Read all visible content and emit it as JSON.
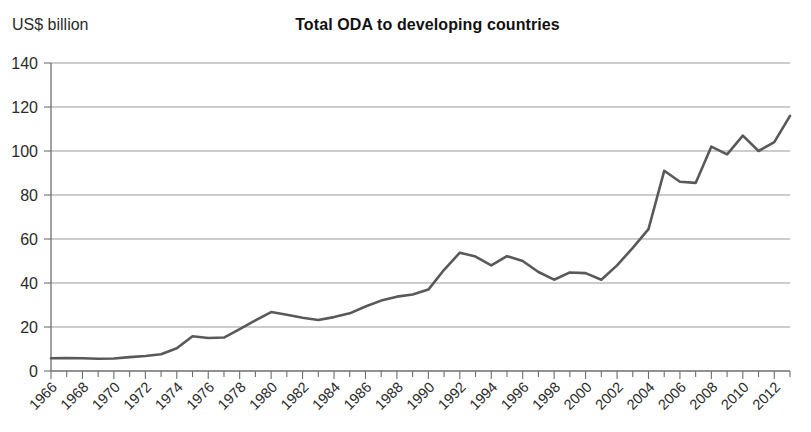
{
  "chart_data": {
    "type": "line",
    "title": "Total ODA to developing countries",
    "ylabel": "US$ billion",
    "xlabel": "",
    "ylim": [
      0,
      140
    ],
    "ytick_step": 20,
    "yticks": [
      0,
      20,
      40,
      60,
      80,
      100,
      120,
      140
    ],
    "grid": true,
    "legend": "none",
    "xtick_labels": [
      "1966",
      "1968",
      "1970",
      "1972",
      "1974",
      "1976",
      "1978",
      "1980",
      "1982",
      "1984",
      "1986",
      "1988",
      "1990",
      "1992",
      "1994",
      "1996",
      "1998",
      "2000",
      "2002",
      "2004",
      "2006",
      "2008",
      "2010",
      "2012"
    ],
    "xtick_label_rotation": 45,
    "x": [
      1966,
      1967,
      1968,
      1969,
      1970,
      1971,
      1972,
      1973,
      1974,
      1975,
      1976,
      1977,
      1978,
      1979,
      1980,
      1981,
      1982,
      1983,
      1984,
      1985,
      1986,
      1987,
      1988,
      1989,
      1990,
      1991,
      1992,
      1993,
      1994,
      1995,
      1996,
      1997,
      1998,
      1999,
      2000,
      2001,
      2002,
      2003,
      2004,
      2005,
      2006,
      2007,
      2008,
      2009,
      2010,
      2011,
      2012,
      2013
    ],
    "series": [
      {
        "name": "Total ODA",
        "color": "#595959",
        "values": [
          5.8,
          5.9,
          5.8,
          5.6,
          5.7,
          6.3,
          6.8,
          7.6,
          10.3,
          15.8,
          15.0,
          15.2,
          19.0,
          23.0,
          26.8,
          25.6,
          24.2,
          23.2,
          24.5,
          26.2,
          29.3,
          32.0,
          33.8,
          34.8,
          37.0,
          46.0,
          53.8,
          52.0,
          48.0,
          52.2,
          50.0,
          45.0,
          41.5,
          44.8,
          44.5,
          41.5,
          48.0,
          56.0,
          64.5,
          91.0,
          86.0,
          85.5,
          102.0,
          98.5,
          107.0,
          100.0,
          104.0,
          116.0
        ]
      }
    ]
  },
  "axis_unit_label": "US$ billion"
}
